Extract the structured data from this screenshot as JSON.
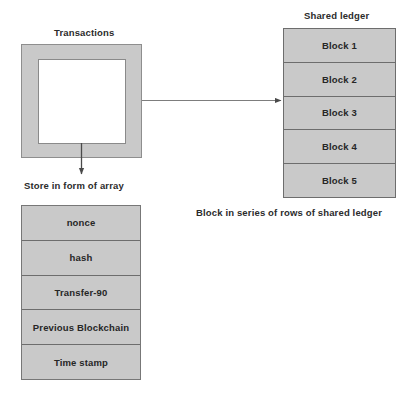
{
  "diagram": {
    "background_color": "#ffffff",
    "fill_color": "#c9c9c9",
    "line_color": "#6d6d6d",
    "text_color": "#262626"
  },
  "transactions": {
    "title": "Transactions",
    "inner_label": ""
  },
  "shared_ledger": {
    "title": "Shared ledger",
    "caption": "Block in series of rows of shared ledger",
    "blocks": [
      {
        "label": "Block 1"
      },
      {
        "label": "Block 2"
      },
      {
        "label": "Block 3"
      },
      {
        "label": "Block 4"
      },
      {
        "label": "Block 5"
      }
    ]
  },
  "array_store": {
    "label": "Store in form of array",
    "rows": [
      {
        "label": "nonce"
      },
      {
        "label": "hash"
      },
      {
        "label": "Transfer-90"
      },
      {
        "label": "Previous Blockchain"
      },
      {
        "label": "Time stamp"
      }
    ]
  },
  "connectors": [
    {
      "name": "transactions-to-ledger",
      "direction": "right"
    },
    {
      "name": "transactions-to-array",
      "direction": "down"
    }
  ]
}
